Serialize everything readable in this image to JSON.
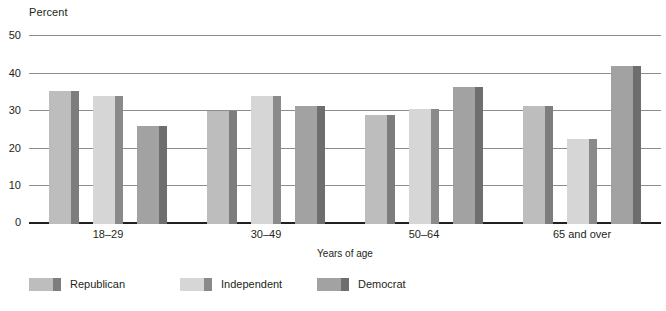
{
  "chart_data": {
    "type": "bar",
    "title": "",
    "subtitle": "",
    "xlabel": "Years of age",
    "ylabel": "Percent",
    "ylim": [
      0,
      50
    ],
    "yticks": [
      0,
      10,
      20,
      30,
      40,
      50
    ],
    "ytick_labels": [
      "0",
      "10",
      "20",
      "30",
      "40",
      "50"
    ],
    "grid": true,
    "legend_position": "bottom-left",
    "categories": [
      "18–29",
      "30–49",
      "50–64",
      "65 and over"
    ],
    "series": [
      {
        "name": "Republican",
        "color": "#bdbdbd",
        "side_color": "#7d7d7d",
        "values": [
          35.5,
          30.0,
          29.0,
          31.5
        ]
      },
      {
        "name": "Independent",
        "color": "#d6d6d6",
        "side_color": "#8a8a8a",
        "values": [
          34.0,
          34.0,
          30.5,
          22.5
        ]
      },
      {
        "name": "Democrat",
        "color": "#a2a2a2",
        "side_color": "#6e6e6e",
        "values": [
          26.0,
          31.5,
          36.5,
          42.0
        ]
      }
    ]
  },
  "axes": {
    "y_title": "Percent",
    "x_title": "Years of age"
  },
  "legend": {
    "items": [
      {
        "label": "Republican"
      },
      {
        "label": "Independent"
      },
      {
        "label": "Democrat"
      }
    ]
  }
}
